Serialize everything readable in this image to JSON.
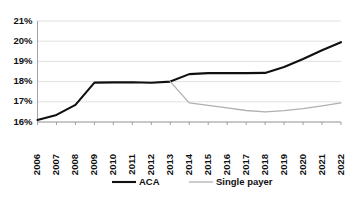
{
  "chart_data": {
    "type": "line",
    "title": "",
    "xlabel": "",
    "ylabel": "",
    "grid": true,
    "legend_position": "bottom",
    "ylim": [
      16,
      21
    ],
    "ytick_labels": [
      "16%",
      "17%",
      "18%",
      "19%",
      "20%",
      "21%"
    ],
    "ytick_values": [
      16,
      17,
      18,
      19,
      20,
      21
    ],
    "categories": [
      "2006",
      "2007",
      "2008",
      "2009",
      "2010",
      "2011",
      "2012",
      "2013",
      "2014",
      "2015",
      "2016",
      "2017",
      "2018",
      "2019",
      "2020",
      "2021",
      "2022"
    ],
    "series": [
      {
        "name": "ACA",
        "color": "#101010",
        "values": [
          16.1,
          16.35,
          16.85,
          17.95,
          17.96,
          17.97,
          17.94,
          18.0,
          18.37,
          18.42,
          18.42,
          18.42,
          18.43,
          18.72,
          19.12,
          19.55,
          19.95
        ]
      },
      {
        "name": "Single payer",
        "color": "#b0b0b0",
        "values": [
          null,
          null,
          null,
          null,
          null,
          null,
          null,
          18.0,
          16.95,
          16.82,
          16.7,
          16.57,
          16.5,
          16.56,
          16.66,
          16.8,
          16.95
        ]
      }
    ],
    "legend": [
      {
        "label": "ACA",
        "color": "#101010"
      },
      {
        "label": "Single payer",
        "color": "#b0b0b0"
      }
    ]
  }
}
